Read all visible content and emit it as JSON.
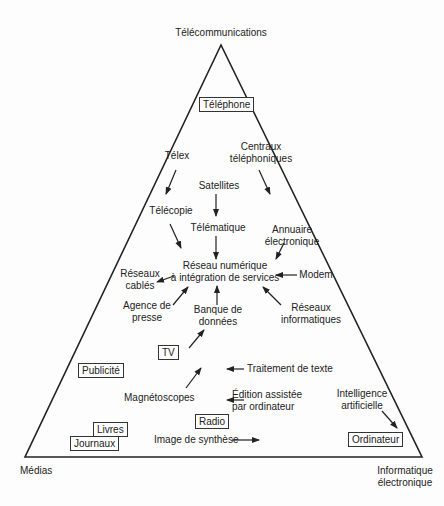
{
  "vertices": {
    "top": "Télécommunications",
    "bottom_left": "Médias",
    "bottom_right": "Informatique\nélectronique"
  },
  "boxed_nodes": {
    "telephone": "Téléphone",
    "tv": "TV",
    "publicite": "Publicité",
    "radio": "Radio",
    "livres": "Livres",
    "journaux": "Journaux",
    "ordinateur": "Ordinateur"
  },
  "nodes": {
    "telex": "Télex",
    "centraux_1": "Centraux",
    "centraux_2": "téléphoniques",
    "satellites": "Satellites",
    "telecopie": "Télécopie",
    "telematique": "Télématique",
    "annuaire_1": "Annuaire",
    "annuaire_2": "électronique",
    "rnis_1": "Réseau numérique",
    "rnis_2": "à intégration de services",
    "reseaux_cables_1": "Réseaux",
    "reseaux_cables_2": "cablés",
    "modem": "Modem",
    "agence_1": "Agence de",
    "agence_2": "presse",
    "banque_1": "Banque de",
    "banque_2": "données",
    "reseaux_info_1": "Réseaux",
    "reseaux_info_2": "informatiques",
    "traitement": "Traitement de texte",
    "magnetoscopes": "Magnétoscopes",
    "edition_1": "Édition assistée",
    "edition_2": "par ordinateur",
    "ia_1": "Intelligence",
    "ia_2": "artificielle",
    "image_synthese": "Image de synthèse"
  }
}
